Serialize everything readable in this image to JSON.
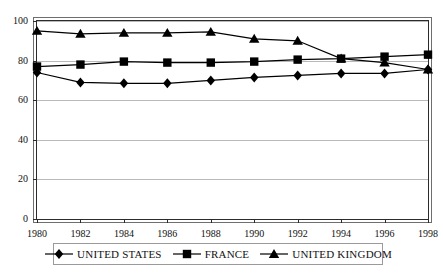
{
  "chart_data": {
    "type": "line",
    "title": "",
    "subtitle": "",
    "xlabel": "",
    "ylabel": "",
    "x": [
      1980,
      1982,
      1984,
      1986,
      1988,
      1990,
      1992,
      1994,
      1996,
      1998
    ],
    "categories": [
      "1980",
      "1982",
      "1984",
      "1986",
      "1988",
      "1990",
      "1992",
      "1994",
      "1996",
      "1998"
    ],
    "xlim": [
      1980,
      1998
    ],
    "ylim": [
      0,
      100
    ],
    "yticks": [
      0,
      20,
      40,
      60,
      80,
      100
    ],
    "ytick_labels": [
      "0",
      "20",
      "40",
      "60",
      "80",
      "100"
    ],
    "grid": true,
    "grid_axis": "y",
    "legend_position": "bottom",
    "series": [
      {
        "name": "UNITED STATES",
        "marker": "diamond",
        "color": "#000000",
        "values": [
          74,
          69,
          68.5,
          68.5,
          70,
          71.5,
          72.5,
          73.5,
          73.5,
          75.5
        ]
      },
      {
        "name": "FRANCE",
        "marker": "square",
        "color": "#000000",
        "values": [
          77,
          78,
          79.5,
          79,
          79,
          79.5,
          80.5,
          81,
          82,
          83
        ]
      },
      {
        "name": "UNITED KINGDOM",
        "marker": "triangle",
        "color": "#000000",
        "values": [
          95,
          93.5,
          94,
          94,
          94.5,
          91,
          90,
          81,
          79,
          75.5
        ]
      }
    ]
  },
  "legend": {
    "items": [
      {
        "label": "UNITED STATES",
        "marker": "diamond"
      },
      {
        "label": "FRANCE",
        "marker": "square"
      },
      {
        "label": "UNITED KINGDOM",
        "marker": "triangle"
      }
    ]
  }
}
